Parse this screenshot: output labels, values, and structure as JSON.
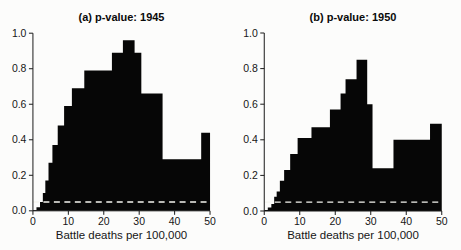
{
  "figure": {
    "background": "#fcfcfb",
    "fill_color": "#060606",
    "axis_color": "#1a1a1a",
    "text_color": "#111111",
    "reference_line_color": "#f5f5f0"
  },
  "chart_data": [
    {
      "type": "area",
      "title": "(a) p-value: 1945",
      "xlabel": "Battle deaths per 100,000",
      "ylabel": "",
      "xlim": [
        0,
        50
      ],
      "ylim": [
        0,
        1
      ],
      "xticks": [
        "0",
        "10",
        "20",
        "30",
        "40",
        "50"
      ],
      "yticks": [
        "0.0",
        "0.2",
        "0.4",
        "0.6",
        "0.8",
        "1.0"
      ],
      "grid": false,
      "legend": false,
      "reference_line": {
        "y": 0.05,
        "style": "dashed"
      },
      "steps": [
        [
          0,
          1,
          0.005
        ],
        [
          1,
          2,
          0.02
        ],
        [
          2,
          2.8,
          0.05
        ],
        [
          2.8,
          3.5,
          0.1
        ],
        [
          3.5,
          4.4,
          0.17
        ],
        [
          4.4,
          5.5,
          0.27
        ],
        [
          5.5,
          7,
          0.37
        ],
        [
          7,
          8.8,
          0.48
        ],
        [
          8.8,
          11,
          0.59
        ],
        [
          11,
          14.5,
          0.69
        ],
        [
          14.5,
          22.3,
          0.79
        ],
        [
          22.3,
          25.4,
          0.89
        ],
        [
          25.4,
          28.7,
          0.96
        ],
        [
          28.7,
          30.6,
          0.89
        ],
        [
          30.6,
          36.6,
          0.66
        ],
        [
          36.6,
          47.5,
          0.29
        ],
        [
          47.5,
          50,
          0.44
        ]
      ]
    },
    {
      "type": "area",
      "title": "(b) p-value: 1950",
      "xlabel": "Battle deaths per 100,000",
      "ylabel": "",
      "xlim": [
        0,
        50
      ],
      "ylim": [
        0,
        1
      ],
      "xticks": [
        "0",
        "10",
        "20",
        "30",
        "40",
        "50"
      ],
      "yticks": [
        "0.0",
        "0.2",
        "0.4",
        "0.6",
        "0.8",
        "1.0"
      ],
      "grid": false,
      "legend": false,
      "reference_line": {
        "y": 0.05,
        "style": "dashed"
      },
      "steps": [
        [
          0,
          1,
          0.005
        ],
        [
          1,
          2,
          0.02
        ],
        [
          2,
          2.8,
          0.04
        ],
        [
          2.8,
          3.5,
          0.08
        ],
        [
          3.5,
          4.4,
          0.11
        ],
        [
          4.4,
          5.6,
          0.17
        ],
        [
          5.6,
          7.3,
          0.23
        ],
        [
          7.3,
          9.4,
          0.32
        ],
        [
          9.4,
          13.3,
          0.41
        ],
        [
          13.3,
          18.5,
          0.47
        ],
        [
          18.5,
          21.5,
          0.57
        ],
        [
          21.5,
          22.9,
          0.66
        ],
        [
          22.9,
          26,
          0.74
        ],
        [
          26,
          29,
          0.85
        ],
        [
          29,
          30.5,
          0.6
        ],
        [
          30.5,
          36.4,
          0.24
        ],
        [
          36.4,
          46.7,
          0.4
        ],
        [
          46.7,
          50,
          0.49
        ]
      ]
    }
  ]
}
